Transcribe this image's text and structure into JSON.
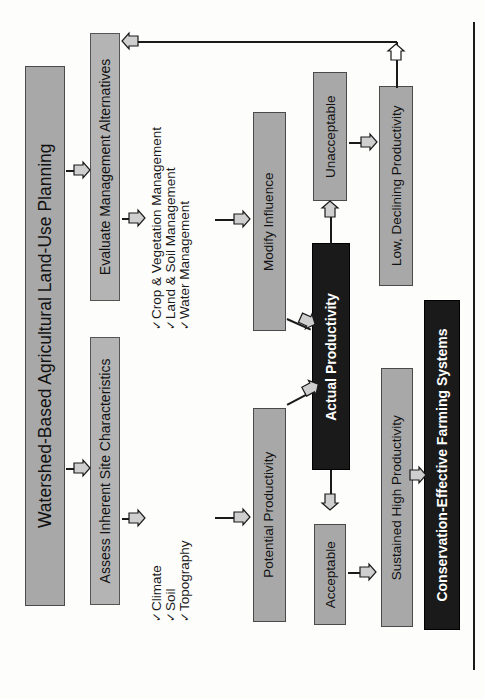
{
  "figure": {
    "orientation": "rotated-90-clockwise",
    "colors": {
      "grey_fill": "#a8a8a8",
      "grey_light_fill": "#b4b4b4",
      "black_fill": "#1a1a1a",
      "line": "#1a1a1a",
      "page_bg": "#fdfdfc"
    }
  },
  "nodes": {
    "title": "Watershed-Based Agricultural Land-Use Planning",
    "evaluate_alternatives": "Evaluate Management Alternatives",
    "assess_site": "Assess Inherent Site Characteristics",
    "modify_influence": "Modify Influence",
    "potential_productivity": "Potential Productivity",
    "unacceptable": "Unacceptable",
    "actual_productivity": "Actual Productivity",
    "acceptable": "Acceptable",
    "low_declining": "Low, Declining Productivity",
    "sustained_high": "Sustained High Productivity",
    "conservation_systems": "Conservation-Effective Farming Systems"
  },
  "bullets": {
    "management": {
      "check_glyph": "✓",
      "items": [
        "Crop & Vegetation Management",
        "Land & Soil Management",
        "Water Management"
      ]
    },
    "site": {
      "check_glyph": "✓",
      "items": [
        "Climate",
        "Soil",
        "Topography"
      ]
    }
  }
}
